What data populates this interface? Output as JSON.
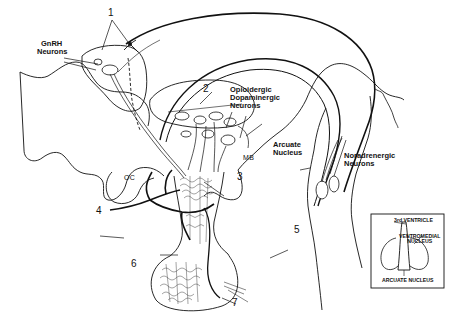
{
  "figure": {
    "type": "neuroanatomical diagram",
    "labels": {
      "gnrh_neurons": "GnRH\nNeurons",
      "gnrh_line1": "GnRH",
      "gnrh_line2": "Neurons",
      "opioid_line1": "Opioidergic",
      "opioid_line2": "Dopaminergic",
      "opioid_line3": "Neurons",
      "arcuate_line1": "Arcuate",
      "arcuate_line2": "Nucleus",
      "noradrenergic_line1": "Noradrenergic",
      "noradrenergic_line2": "Neurons",
      "oc": "OC",
      "mb": "MB"
    },
    "numbers": [
      "1",
      "2",
      "3",
      "4",
      "5",
      "6",
      "7"
    ],
    "inset": {
      "third_ventricle": "3rd VENTRICLE",
      "ventromedial_line1": "VENTROMEDIAL",
      "ventromedial_line2": "NUCLEUS",
      "arcuate_nucleus": "ARCUATE NUCLEUS"
    }
  },
  "colors": {
    "ink": "#111111",
    "background": "#ffffff",
    "stipple": "#9a9a9a"
  }
}
